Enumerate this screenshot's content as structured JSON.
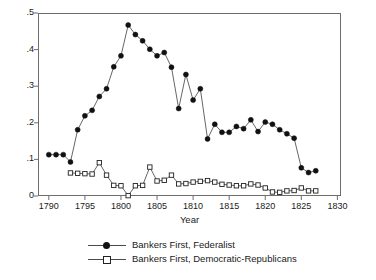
{
  "chart_data": {
    "type": "line",
    "title": "",
    "subtitle": "",
    "xlabel": "Year",
    "ylabel": "",
    "xlim": [
      1788.5,
      1830.5
    ],
    "ylim": [
      0,
      0.5
    ],
    "grid": false,
    "legend_position": "bottom-center",
    "x_ticks": [
      1790,
      1795,
      1800,
      1805,
      1810,
      1815,
      1820,
      1825,
      1830
    ],
    "x_tick_labels": [
      "1790",
      "1795",
      "1800",
      "1805",
      "1810",
      "1815",
      "1820",
      "1825",
      "1830"
    ],
    "y_ticks": [
      0,
      0.1,
      0.2,
      0.3,
      0.4,
      0.5
    ],
    "y_tick_labels": [
      "0",
      ".1",
      ".2",
      ".3",
      ".4",
      ".5"
    ],
    "x": [
      1790,
      1791,
      1792,
      1793,
      1794,
      1795,
      1796,
      1797,
      1798,
      1799,
      1800,
      1801,
      1802,
      1803,
      1804,
      1805,
      1806,
      1807,
      1808,
      1809,
      1810,
      1811,
      1812,
      1813,
      1814,
      1815,
      1816,
      1817,
      1818,
      1819,
      1820,
      1821,
      1822,
      1823,
      1824,
      1825,
      1826,
      1827
    ],
    "series": [
      {
        "name": "Bankers First, Federalist",
        "marker": "filled-circle",
        "color": "#111111",
        "values": [
          0.113,
          0.113,
          0.113,
          0.093,
          0.181,
          0.219,
          0.234,
          0.272,
          0.293,
          0.353,
          0.383,
          0.467,
          0.441,
          0.424,
          0.401,
          0.383,
          0.392,
          0.352,
          0.239,
          0.332,
          0.262,
          0.293,
          0.156,
          0.196,
          0.174,
          0.174,
          0.19,
          0.184,
          0.208,
          0.176,
          0.202,
          0.196,
          0.181,
          0.17,
          0.158,
          0.077,
          0.064,
          0.069
        ]
      },
      {
        "name": "Bankers First, Democratic-Republicans",
        "marker": "hollow-square",
        "color": "#222222",
        "values": [
          null,
          null,
          null,
          0.063,
          0.062,
          0.061,
          0.06,
          0.091,
          0.057,
          0.029,
          0.028,
          0.001,
          0.028,
          0.029,
          0.079,
          0.041,
          0.043,
          0.057,
          0.033,
          0.034,
          0.038,
          0.04,
          0.042,
          0.038,
          0.032,
          0.03,
          0.028,
          0.028,
          0.033,
          0.03,
          0.022,
          0.011,
          0.01,
          0.014,
          0.015,
          0.022,
          0.014,
          0.014
        ]
      }
    ]
  },
  "axis": {
    "x_title": "Year"
  },
  "legend": {
    "entries": [
      {
        "label": "Bankers First, Federalist"
      },
      {
        "label": "Bankers First, Democratic-Republicans"
      }
    ]
  }
}
